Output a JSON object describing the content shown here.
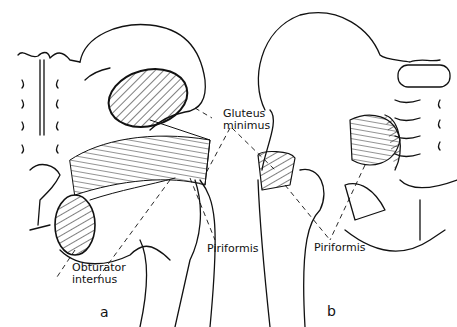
{
  "labels": {
    "gluteus_line1": "Gluteus",
    "gluteus_line2": "minimus",
    "piriformis_a": "Piriformis",
    "piriformis_b": "Piriformis",
    "obturator_line1": "Obturator",
    "obturator_line2": "internus"
  },
  "panels": {
    "a": "a",
    "b": "b"
  },
  "colors": {
    "ink": "#111111",
    "background": "#ffffff"
  }
}
